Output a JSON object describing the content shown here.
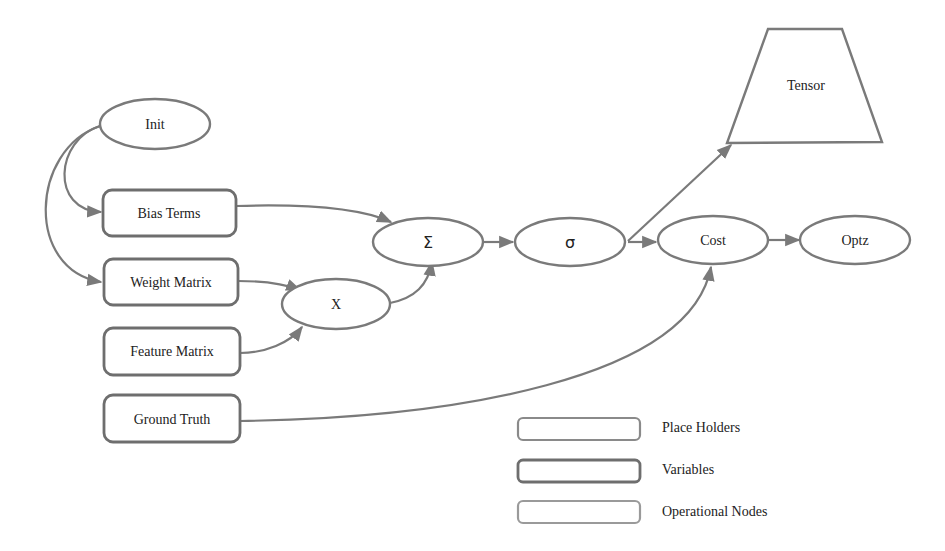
{
  "diagram": {
    "title": "",
    "colors": {
      "stroke": "#7a7a7a",
      "fill": "#ffffff",
      "text": "#222222"
    },
    "nodes": {
      "init": {
        "label": "Init",
        "shape": "ellipse",
        "type": "operational"
      },
      "bias_terms": {
        "label": "Bias Terms",
        "shape": "rounded-rect",
        "type": "variable"
      },
      "weight_matrix": {
        "label": "Weight Matrix",
        "shape": "rounded-rect",
        "type": "variable"
      },
      "feature_matrix": {
        "label": "Feature Matrix",
        "shape": "rounded-rect",
        "type": "placeholder"
      },
      "ground_truth": {
        "label": "Ground Truth",
        "shape": "rounded-rect",
        "type": "placeholder"
      },
      "multiply": {
        "label": "X",
        "shape": "ellipse",
        "type": "operational"
      },
      "sum": {
        "label": "Σ",
        "shape": "ellipse",
        "type": "operational"
      },
      "sigmoid": {
        "label": "σ",
        "shape": "ellipse",
        "type": "operational"
      },
      "cost": {
        "label": "Cost",
        "shape": "ellipse",
        "type": "operational"
      },
      "optz": {
        "label": "Optz",
        "shape": "ellipse",
        "type": "operational"
      },
      "tensor": {
        "label": "Tensor",
        "shape": "trapezoid",
        "type": "output"
      }
    },
    "edges": [
      {
        "from": "Init",
        "to": "Bias Terms"
      },
      {
        "from": "Init",
        "to": "Weight Matrix"
      },
      {
        "from": "Bias Terms",
        "to": "Σ"
      },
      {
        "from": "Weight Matrix",
        "to": "X"
      },
      {
        "from": "Feature Matrix",
        "to": "X"
      },
      {
        "from": "X",
        "to": "Σ"
      },
      {
        "from": "Σ",
        "to": "σ"
      },
      {
        "from": "σ",
        "to": "Tensor"
      },
      {
        "from": "σ",
        "to": "Cost"
      },
      {
        "from": "Ground Truth",
        "to": "Cost"
      },
      {
        "from": "Cost",
        "to": "Optz"
      }
    ],
    "legend": [
      {
        "label": "Place Holders",
        "style": "placeholder"
      },
      {
        "label": "Variables",
        "style": "variable"
      },
      {
        "label": "Operational Nodes",
        "style": "operational"
      }
    ]
  }
}
